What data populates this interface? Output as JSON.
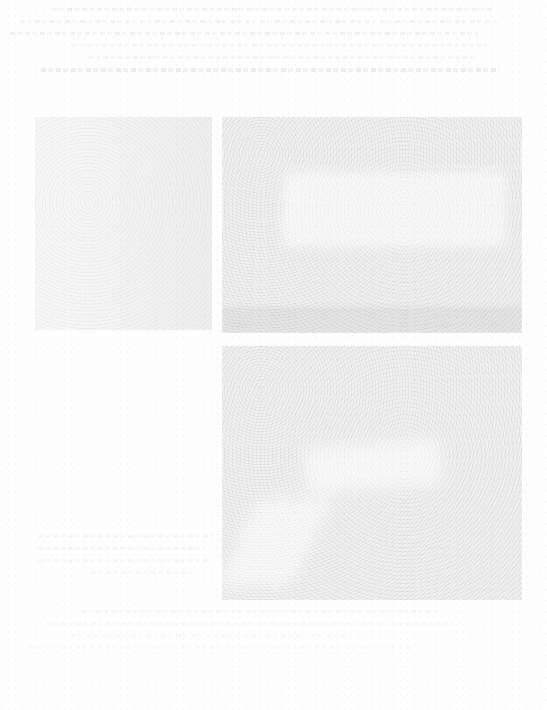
{
  "document": {
    "type": "scanned-page",
    "legibility": "text too faded to read",
    "header_text": {
      "lines": [
        "",
        "",
        "",
        "",
        "",
        ""
      ],
      "note": "illegible faded text"
    },
    "figures": [
      {
        "id": "fig-left",
        "label": "",
        "description": "faded photographic plate (left)"
      },
      {
        "id": "fig-top-right",
        "label": "",
        "description": "faded photographic plate (top right)"
      },
      {
        "id": "fig-bottom-right",
        "label": "",
        "description": "faded photographic plate (bottom right)"
      }
    ],
    "caption": {
      "lines": [
        "",
        "",
        "",
        ""
      ],
      "note": "illegible faded caption"
    },
    "footer_text": {
      "lines": [
        "",
        "",
        "",
        ""
      ],
      "note": "illegible faded text"
    }
  }
}
